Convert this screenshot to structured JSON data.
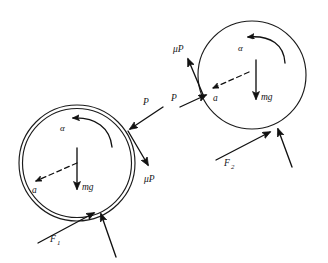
{
  "figure": {
    "type": "physics-free-body-diagram",
    "background_color": "#ffffff",
    "stroke_color": "#1b1b1b",
    "width": 328,
    "height": 263
  },
  "bodies": [
    {
      "id": "left",
      "name": "hoop",
      "shape": "double-circle",
      "center": {
        "x": 77,
        "y": 163
      },
      "outer_radius": 58,
      "inner_radius": 54,
      "labels": {
        "alpha": "α",
        "acceleration": "a",
        "weight": "mg",
        "applied_force": "P",
        "friction_surface": "μP",
        "ground_friction": "F",
        "ground_friction_sub": "1"
      }
    },
    {
      "id": "right",
      "name": "disk",
      "shape": "single-circle",
      "center": {
        "x": 252,
        "y": 75
      },
      "outer_radius": 54,
      "labels": {
        "alpha": "α",
        "acceleration": "a",
        "weight": "mg",
        "applied_force": "P",
        "friction_surface": "μP",
        "ground_friction": "F",
        "ground_friction_sub": "2"
      }
    }
  ],
  "vectors": {
    "left": {
      "P": {
        "label": "P",
        "direction": "down-left",
        "description": "applied force pressing on upper-right rim"
      },
      "muP": {
        "label": "μP",
        "direction": "down-right",
        "description": "friction from pressing pad, tangential"
      },
      "mg": {
        "label": "mg",
        "direction": "down",
        "description": "weight at center"
      },
      "a": {
        "label": "a",
        "direction": "left-down",
        "style": "dashed",
        "description": "linear acceleration of center"
      },
      "alpha": {
        "label": "α",
        "direction": "counterclockwise",
        "style": "curved",
        "description": "angular acceleration"
      },
      "F1": {
        "label": "F",
        "subscript": "1",
        "direction": "up-right",
        "description": "ground friction at contact point"
      },
      "N": {
        "label": "",
        "direction": "up",
        "description": "normal reaction at contact point"
      }
    },
    "right": {
      "P": {
        "label": "P",
        "direction": "right",
        "description": "applied force pushing on left rim"
      },
      "muP": {
        "label": "μP",
        "direction": "up-left",
        "description": "friction from pressing pad, tangential"
      },
      "mg": {
        "label": "mg",
        "direction": "down",
        "description": "weight at center"
      },
      "a": {
        "label": "a",
        "direction": "left",
        "style": "dashed",
        "description": "linear acceleration of center"
      },
      "alpha": {
        "label": "α",
        "direction": "counterclockwise",
        "style": "curved",
        "description": "angular acceleration"
      },
      "F2": {
        "label": "F",
        "subscript": "2",
        "direction": "up-right",
        "description": "ground friction at contact point"
      },
      "N": {
        "label": "",
        "direction": "up",
        "description": "normal reaction at contact point"
      }
    }
  }
}
